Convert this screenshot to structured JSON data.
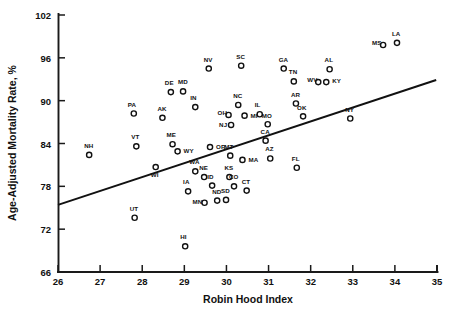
{
  "chart_data": {
    "type": "scatter",
    "title": "",
    "xlabel": "Robin Hood Index",
    "ylabel": "Age-Adjusted Mortality Rate, %",
    "xlim": [
      26,
      35
    ],
    "ylim": [
      66,
      102
    ],
    "xticks": [
      26,
      27,
      28,
      29,
      30,
      31,
      32,
      33,
      34,
      35
    ],
    "yticks": [
      66,
      72,
      78,
      84,
      90,
      96,
      102
    ],
    "grid": false,
    "legend": null,
    "marker_style": "open-circle",
    "trendline": {
      "label": "regression-line",
      "x0": 26.0,
      "y0": 75.4,
      "x1": 34.98,
      "y1": 92.9
    },
    "points": [
      {
        "label": "NH",
        "x": 26.74,
        "y": 82.4
      },
      {
        "label": "UT",
        "x": 27.82,
        "y": 73.6
      },
      {
        "label": "PA",
        "x": 27.8,
        "y": 88.2
      },
      {
        "label": "VT",
        "x": 27.86,
        "y": 83.6
      },
      {
        "label": "AK",
        "x": 28.48,
        "y": 87.6
      },
      {
        "label": "DE",
        "x": 28.68,
        "y": 91.2
      },
      {
        "label": "WI",
        "x": 28.32,
        "y": 80.7
      },
      {
        "label": "MD",
        "x": 28.97,
        "y": 91.3
      },
      {
        "label": "ME",
        "x": 28.72,
        "y": 83.9
      },
      {
        "label": "WY",
        "x": 28.84,
        "y": 82.9
      },
      {
        "label": "IN",
        "x": 29.26,
        "y": 89.1
      },
      {
        "label": "NV",
        "x": 29.58,
        "y": 94.5
      },
      {
        "label": "HI",
        "x": 29.02,
        "y": 69.6
      },
      {
        "label": "IA",
        "x": 29.09,
        "y": 77.3
      },
      {
        "label": "WA",
        "x": 29.26,
        "y": 80.1
      },
      {
        "label": "NE",
        "x": 29.47,
        "y": 79.3
      },
      {
        "label": "MN",
        "x": 29.48,
        "y": 75.7
      },
      {
        "label": "ID",
        "x": 29.66,
        "y": 78.1
      },
      {
        "label": "ND",
        "x": 29.78,
        "y": 76.0
      },
      {
        "label": "SD",
        "x": 29.99,
        "y": 76.1
      },
      {
        "label": "OR",
        "x": 29.61,
        "y": 83.5
      },
      {
        "label": "KS",
        "x": 30.07,
        "y": 79.3
      },
      {
        "label": "CO",
        "x": 30.18,
        "y": 78.0
      },
      {
        "label": "OH",
        "x": 30.05,
        "y": 88.0
      },
      {
        "label": "NJ",
        "x": 30.11,
        "y": 86.6
      },
      {
        "label": "NC",
        "x": 30.28,
        "y": 89.4
      },
      {
        "label": "MI",
        "x": 30.43,
        "y": 87.9
      },
      {
        "label": "MT",
        "x": 30.09,
        "y": 82.3
      },
      {
        "label": "MA",
        "x": 30.38,
        "y": 81.7
      },
      {
        "label": "CT",
        "x": 30.48,
        "y": 77.4
      },
      {
        "label": "IL",
        "x": 30.79,
        "y": 88.1
      },
      {
        "label": "SC",
        "x": 30.35,
        "y": 94.9
      },
      {
        "label": "AZ",
        "x": 31.04,
        "y": 81.9
      },
      {
        "label": "CA",
        "x": 30.93,
        "y": 84.4
      },
      {
        "label": "MO",
        "x": 30.98,
        "y": 86.7
      },
      {
        "label": "GA",
        "x": 31.36,
        "y": 94.5
      },
      {
        "label": "TN",
        "x": 31.6,
        "y": 92.7
      },
      {
        "label": "AR",
        "x": 31.65,
        "y": 89.6
      },
      {
        "label": "FL",
        "x": 31.67,
        "y": 80.6
      },
      {
        "label": "OK",
        "x": 31.82,
        "y": 87.8
      },
      {
        "label": "WV",
        "x": 32.18,
        "y": 92.6
      },
      {
        "label": "KY",
        "x": 32.37,
        "y": 92.6
      },
      {
        "label": "AL",
        "x": 32.45,
        "y": 94.4
      },
      {
        "label": "NY",
        "x": 32.94,
        "y": 87.5
      },
      {
        "label": "MS",
        "x": 33.72,
        "y": 97.8
      },
      {
        "label": "LA",
        "x": 34.05,
        "y": 98.1
      }
    ]
  },
  "label_offsets": {
    "NH": [
      -5,
      -7
    ],
    "UT": [
      -5,
      -7
    ],
    "PA": [
      -6,
      -7
    ],
    "VT": [
      -5,
      -7
    ],
    "AK": [
      -5,
      -7
    ],
    "DE": [
      -6,
      -7
    ],
    "WI": [
      -5,
      10
    ],
    "MD": [
      -5,
      -7
    ],
    "ME": [
      -6,
      -7
    ],
    "WY": [
      6,
      2
    ],
    "IN": [
      -5,
      -7
    ],
    "NV": [
      -5,
      -7
    ],
    "HI": [
      -5,
      -7
    ],
    "IA": [
      -5,
      -7
    ],
    "WA": [
      -6,
      -7
    ],
    "NE": [
      -5,
      -7
    ],
    "MN": [
      -12,
      1
    ],
    "ID": [
      -5,
      -7
    ],
    "ND": [
      -5,
      -7
    ],
    "SD": [
      -5,
      -7
    ],
    "OR": [
      6,
      2
    ],
    "KS": [
      -5,
      -7
    ],
    "CO": [
      -5,
      -7
    ],
    "OH": [
      -11,
      0
    ],
    "NJ": [
      -12,
      2
    ],
    "NC": [
      -5,
      -7
    ],
    "MI": [
      6,
      2
    ],
    "MT": [
      -6,
      -7
    ],
    "MA": [
      6,
      2
    ],
    "CT": [
      -5,
      -7
    ],
    "IL": [
      -5,
      -7
    ],
    "SC": [
      -5,
      -7
    ],
    "AZ": [
      -5,
      -7
    ],
    "CA": [
      -5,
      -7
    ],
    "MO": [
      -6,
      -6
    ],
    "GA": [
      -5,
      -7
    ],
    "TN": [
      -5,
      -7
    ],
    "AR": [
      -5,
      -7
    ],
    "FL": [
      -5,
      -7
    ],
    "OK": [
      -6,
      -6
    ],
    "WV": [
      -11,
      0
    ],
    "KY": [
      6,
      1
    ],
    "AL": [
      -5,
      -7
    ],
    "NY": [
      -5,
      -7
    ],
    "MS": [
      -11,
      0
    ],
    "LA": [
      -5,
      -7
    ]
  },
  "axes": {
    "x_title": "Robin Hood Index",
    "y_title": "Age-Adjusted Mortality Rate, %"
  }
}
